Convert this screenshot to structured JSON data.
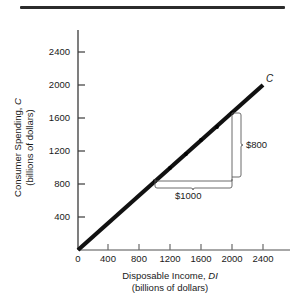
{
  "figure": {
    "top_rule": "horizontal-rule"
  },
  "chart_data": {
    "type": "line",
    "title": "",
    "subtitle": "",
    "xlabel": "Disposable Income, DI",
    "xlabel_units": "(billions of dollars)",
    "ylabel": "Consumer Spending, C",
    "ylabel_units": "(billions of dollars)",
    "xlim": [
      0,
      2500
    ],
    "ylim": [
      0,
      2600
    ],
    "xticks": [
      0,
      400,
      800,
      1200,
      1600,
      2000,
      2400
    ],
    "yticks": [
      400,
      800,
      1200,
      1600,
      2000,
      2400
    ],
    "xtick_labels": [
      "0",
      "400",
      "800",
      "1200",
      "1600",
      "2000",
      "2400"
    ],
    "ytick_labels": [
      "400",
      "800",
      "1200",
      "1600",
      "2000",
      "2400"
    ],
    "grid": false,
    "legend": "none",
    "series": [
      {
        "name": "C",
        "label": "C",
        "color": "#111111",
        "slope": 0.8333,
        "intercept": 0,
        "x": [
          0,
          2400
        ],
        "y": [
          0,
          2000
        ],
        "markers_x": [
          1000,
          1200,
          1400,
          1600,
          1800,
          2000
        ],
        "markers_y": [
          833,
          1000,
          1167,
          1333,
          1500,
          1667
        ]
      }
    ],
    "annotations": [
      {
        "name": "horizontal-bracket",
        "label": "$1000",
        "axis": "x",
        "from": 1000,
        "to": 2000,
        "value": 1000
      },
      {
        "name": "vertical-bracket",
        "label": "$800",
        "axis": "y",
        "from": 833,
        "to": 1667,
        "value": 800
      }
    ]
  }
}
